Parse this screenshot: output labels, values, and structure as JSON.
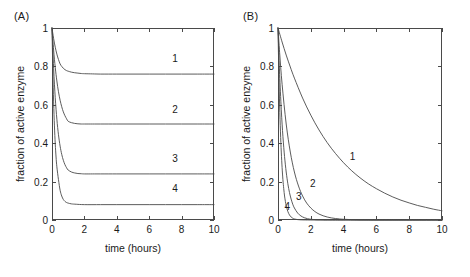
{
  "figure": {
    "background": "#ffffff",
    "line_color": "#4a4a4a",
    "text_color": "#1a1a1a"
  },
  "panels": [
    {
      "id": "A",
      "label": "(A)",
      "chart_data": {
        "type": "line",
        "title": "",
        "xlabel": "time (hours)",
        "ylabel": "fraction of active enzyme",
        "xlim": [
          0,
          10
        ],
        "ylim": [
          0,
          1
        ],
        "xticks": [
          0,
          2,
          4,
          6,
          8,
          10
        ],
        "xticklabels": [
          "0",
          "2",
          "4",
          "6",
          "8",
          "10"
        ],
        "yticks": [
          0,
          0.2,
          0.4,
          0.6,
          0.8,
          1
        ],
        "yticklabels": [
          "0",
          "0.2",
          "0.4",
          "0.6",
          "0.8",
          "1"
        ],
        "grid": false,
        "legend": "inline-curve-labels",
        "series": [
          {
            "name": "1",
            "label_x": 7.6,
            "label_y": 0.845,
            "plateau": 0.76,
            "x": [
              0,
              0.1,
              0.2,
              0.3,
              0.4,
              0.5,
              0.6,
              0.7,
              0.8,
              0.9,
              1.0,
              1.2,
              1.4,
              1.6,
              1.8,
              2.0,
              2.5,
              3.0,
              4.0,
              5.0,
              6.0,
              7.0,
              8.0,
              9.0,
              10.0
            ],
            "y": [
              1.0,
              0.945,
              0.9,
              0.864,
              0.836,
              0.813,
              0.8,
              0.79,
              0.783,
              0.778,
              0.775,
              0.77,
              0.767,
              0.765,
              0.763,
              0.762,
              0.761,
              0.76,
              0.76,
              0.76,
              0.76,
              0.76,
              0.76,
              0.76,
              0.76
            ]
          },
          {
            "name": "2",
            "label_x": 7.6,
            "label_y": 0.58,
            "plateau": 0.5,
            "x": [
              0,
              0.1,
              0.2,
              0.3,
              0.4,
              0.5,
              0.6,
              0.7,
              0.8,
              0.9,
              1.0,
              1.2,
              1.4,
              1.6,
              1.8,
              2.0,
              2.5,
              3.0,
              4.0,
              5.0,
              6.0,
              7.0,
              8.0,
              9.0,
              10.0
            ],
            "y": [
              1.0,
              0.885,
              0.795,
              0.724,
              0.668,
              0.624,
              0.59,
              0.563,
              0.543,
              0.527,
              0.514,
              0.507,
              0.503,
              0.501,
              0.5,
              0.5,
              0.5,
              0.5,
              0.5,
              0.5,
              0.5,
              0.5,
              0.5,
              0.5,
              0.5
            ]
          },
          {
            "name": "3",
            "label_x": 7.6,
            "label_y": 0.325,
            "plateau": 0.24,
            "x": [
              0,
              0.1,
              0.2,
              0.3,
              0.4,
              0.5,
              0.6,
              0.7,
              0.8,
              0.9,
              1.0,
              1.2,
              1.4,
              1.6,
              1.8,
              2.0,
              2.5,
              3.0,
              4.0,
              5.0,
              6.0,
              7.0,
              8.0,
              9.0,
              10.0
            ],
            "y": [
              1.0,
              0.79,
              0.637,
              0.525,
              0.444,
              0.385,
              0.342,
              0.311,
              0.288,
              0.272,
              0.26,
              0.25,
              0.245,
              0.242,
              0.241,
              0.24,
              0.24,
              0.24,
              0.24,
              0.24,
              0.24,
              0.24,
              0.24,
              0.24,
              0.24
            ]
          },
          {
            "name": "4",
            "label_x": 7.6,
            "label_y": 0.165,
            "plateau": 0.08,
            "x": [
              0,
              0.05,
              0.1,
              0.15,
              0.2,
              0.25,
              0.3,
              0.4,
              0.5,
              0.6,
              0.7,
              0.8,
              0.9,
              1.0,
              1.2,
              1.5,
              2.0,
              3.0,
              4.0,
              5.0,
              6.0,
              7.0,
              8.0,
              9.0,
              10.0
            ],
            "y": [
              1.0,
              0.78,
              0.615,
              0.49,
              0.397,
              0.328,
              0.277,
              0.21,
              0.155,
              0.125,
              0.107,
              0.097,
              0.091,
              0.088,
              0.084,
              0.082,
              0.08,
              0.08,
              0.08,
              0.08,
              0.08,
              0.08,
              0.08,
              0.08,
              0.08
            ]
          }
        ]
      }
    },
    {
      "id": "B",
      "label": "(B)",
      "chart_data": {
        "type": "line",
        "title": "",
        "xlabel": "time (hours)",
        "ylabel": "fraction of active enzyme",
        "xlim": [
          0,
          10
        ],
        "ylim": [
          0,
          1
        ],
        "xticks": [
          0,
          2,
          4,
          6,
          8,
          10
        ],
        "xticklabels": [
          "0",
          "2",
          "4",
          "6",
          "8",
          "10"
        ],
        "yticks": [
          0,
          0.2,
          0.4,
          0.6,
          0.8,
          1
        ],
        "yticklabels": [
          "0",
          "0.2",
          "0.4",
          "0.6",
          "0.8",
          "1"
        ],
        "grid": false,
        "legend": "inline-curve-labels",
        "series": [
          {
            "name": "1",
            "label_x": 4.55,
            "label_y": 0.335,
            "x": [
              0,
              0.25,
              0.5,
              0.75,
              1.0,
              1.5,
              2.0,
              2.5,
              3.0,
              3.5,
              4.0,
              4.5,
              5.0,
              5.5,
              6.0,
              6.5,
              7.0,
              7.5,
              8.0,
              8.5,
              9.0,
              9.5,
              10.0
            ],
            "y": [
              1.0,
              0.927,
              0.859,
              0.797,
              0.739,
              0.635,
              0.546,
              0.469,
              0.403,
              0.347,
              0.298,
              0.256,
              0.22,
              0.189,
              0.163,
              0.14,
              0.12,
              0.103,
              0.089,
              0.076,
              0.066,
              0.056,
              0.048
            ]
          },
          {
            "name": "2",
            "label_x": 2.12,
            "label_y": 0.195,
            "x": [
              0,
              0.1,
              0.25,
              0.5,
              0.75,
              1.0,
              1.25,
              1.5,
              1.75,
              2.0,
              2.25,
              2.5,
              2.75,
              3.0,
              3.25,
              3.5,
              3.75,
              4.0,
              4.5,
              5.0,
              5.5,
              6.0,
              7.0,
              8.0,
              10.0
            ],
            "y": [
              1.0,
              0.871,
              0.707,
              0.5,
              0.354,
              0.25,
              0.177,
              0.125,
              0.088,
              0.0625,
              0.044,
              0.031,
              0.022,
              0.0156,
              0.011,
              0.0078,
              0.0055,
              0.0039,
              0.002,
              0.001,
              0.0005,
              0.0002,
              0.0001,
              0.0,
              0.0
            ]
          },
          {
            "name": "3",
            "label_x": 1.27,
            "label_y": 0.125,
            "x": [
              0,
              0.05,
              0.1,
              0.2,
              0.3,
              0.4,
              0.5,
              0.6,
              0.7,
              0.8,
              0.9,
              1.0,
              1.2,
              1.4,
              1.6,
              1.8,
              2.0,
              2.25,
              2.5,
              3.0,
              3.5,
              4.0,
              5.0,
              7.0,
              10.0
            ],
            "y": [
              1.0,
              0.871,
              0.758,
              0.574,
              0.435,
              0.33,
              0.25,
              0.189,
              0.143,
              0.109,
              0.082,
              0.0625,
              0.036,
              0.021,
              0.012,
              0.0068,
              0.0039,
              0.0019,
              0.001,
              0.0002,
              0.0001,
              0.0,
              0.0,
              0.0,
              0.0
            ]
          },
          {
            "name": "4",
            "label_x": 0.56,
            "label_y": 0.072,
            "x": [
              0,
              0.03,
              0.06,
              0.1,
              0.15,
              0.2,
              0.25,
              0.3,
              0.35,
              0.4,
              0.45,
              0.5,
              0.6,
              0.7,
              0.8,
              0.9,
              1.0,
              1.2,
              1.4,
              1.6,
              2.0,
              2.5,
              3.0,
              5.0,
              10.0
            ],
            "y": [
              1.0,
              0.858,
              0.737,
              0.595,
              0.459,
              0.354,
              0.273,
              0.21,
              0.163,
              0.125,
              0.097,
              0.0745,
              0.0443,
              0.0264,
              0.0157,
              0.0093,
              0.0055,
              0.002,
              0.0007,
              0.0002,
              0.0,
              0.0,
              0.0,
              0.0,
              0.0
            ]
          }
        ]
      }
    }
  ]
}
